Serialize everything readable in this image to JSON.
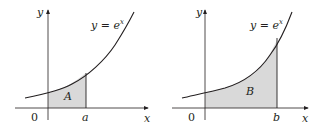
{
  "figure": {
    "panels": [
      {
        "id": "left",
        "function_label": "y = e",
        "function_exponent": "x",
        "axis_x_label": "x",
        "axis_y_label": "y",
        "origin_label": "0",
        "bound_label": "a",
        "region_label": "A"
      },
      {
        "id": "right",
        "function_label": "y = e",
        "function_exponent": "x",
        "axis_x_label": "x",
        "axis_y_label": "y",
        "origin_label": "0",
        "bound_label": "b",
        "region_label": "B"
      }
    ],
    "colors": {
      "shade": "#d9d9d9",
      "line": "#231f20",
      "axis": "#231f20"
    }
  }
}
